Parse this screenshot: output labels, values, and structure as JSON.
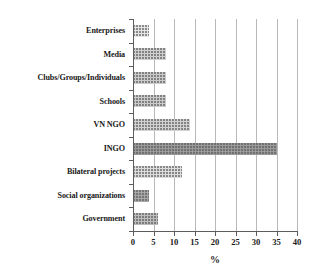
{
  "chart_data": {
    "type": "bar",
    "orientation": "horizontal",
    "title": "",
    "subtitle": "",
    "xlabel": "%",
    "ylabel": "",
    "categories": [
      "Enterprises",
      "Media",
      "Clubs/Groups/Individuals",
      "Schools",
      "VN NGO",
      "INGO",
      "Bilateral projects",
      "Social organizations",
      "Government"
    ],
    "values": [
      4,
      8,
      8,
      8,
      14,
      35,
      12,
      4,
      6
    ],
    "xlim": [
      0,
      40
    ],
    "xticks": [
      0,
      5,
      10,
      15,
      20,
      25,
      30,
      35,
      40
    ],
    "xticklabels": [
      "0",
      "5",
      "10",
      "15",
      "20",
      "25",
      "30",
      "35",
      "40"
    ],
    "grid": true,
    "grid_axis": "x",
    "legend": false,
    "bar_colors": [
      "#e4e4e4",
      "#cfcfcf",
      "#cbcbcb",
      "#cbcbcb",
      "#d2d2d2",
      "#9a9a9a",
      "#dcdcdc",
      "#a8a8a8",
      "#bdbdbd"
    ],
    "axis_color": "#5d5d5d",
    "grid_color": "#b9b9b9",
    "text_color": "#1a1a1a",
    "background": "#ffffff"
  }
}
